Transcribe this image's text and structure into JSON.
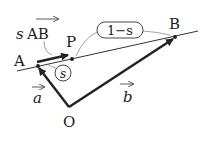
{
  "diagram": {
    "type": "vector-geometry",
    "points": {
      "A": {
        "label": "A",
        "x": 38,
        "y": 66
      },
      "P": {
        "label": "P",
        "x": 72,
        "y": 59
      },
      "B": {
        "label": "B",
        "x": 175,
        "y": 37
      },
      "O": {
        "label": "O",
        "x": 69,
        "y": 107
      }
    },
    "vectors": {
      "a": {
        "label": "a",
        "from": "O",
        "to": "A"
      },
      "b": {
        "label": "b",
        "from": "O",
        "to": "B"
      },
      "sAB": {
        "coef": "s",
        "label": "AB",
        "from": "A",
        "to": "P"
      }
    },
    "ratios": {
      "AP": "s",
      "PB": "1−s"
    },
    "colors": {
      "ink": "#222222",
      "thin": "#555555",
      "background": "#ffffff"
    }
  }
}
